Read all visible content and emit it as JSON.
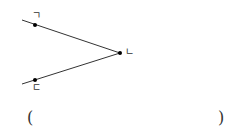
{
  "diagram": {
    "type": "angle",
    "points": {
      "top": {
        "label": "ㄱ",
        "x": 35,
        "y": 25
      },
      "vertex": {
        "label": "ㄴ",
        "x": 120,
        "y": 53
      },
      "bottom": {
        "label": "ㄷ",
        "x": 35,
        "y": 80
      }
    },
    "line_color": "#333333"
  },
  "answer": {
    "open_paren": "(",
    "close_paren": ")",
    "value": ""
  }
}
